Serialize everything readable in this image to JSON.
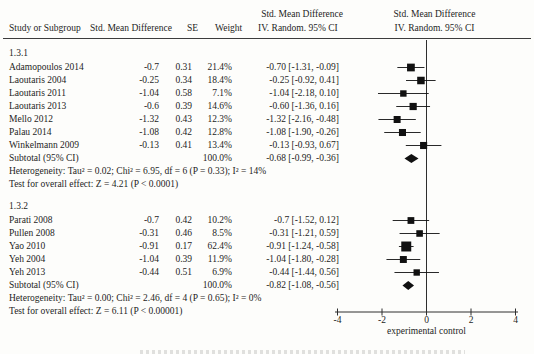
{
  "headers": {
    "left_effect": "Std. Mean Difference",
    "study": "Study or Subgroup",
    "smd": "Std. Mean Difference",
    "se": "SE",
    "weight": "Weight",
    "ci": "IV. Random. 95% CI",
    "plot_effect": "Std. Mean Difference",
    "plot_method": "IV. Random. 95% CI"
  },
  "chart_data": {
    "type": "forest",
    "effect_measure": "Std. Mean Difference",
    "method": "IV. Random. 95% CI",
    "axis": {
      "min": -4,
      "max": 4,
      "ticks": [
        -4,
        -2,
        0,
        2,
        4
      ],
      "label": "experimental control"
    },
    "marker_color": "#111111",
    "subgroups": [
      {
        "label": "1.3.1",
        "studies": [
          {
            "name": "Adamopoulos 2014",
            "smd": "-0.7",
            "se": "0.31",
            "weight": "21.4%",
            "ci": "-0.70 [-1.31, -0.09]",
            "est": -0.7,
            "lo": -1.31,
            "hi": -0.09,
            "w": 21.4
          },
          {
            "name": "Laoutaris 2004",
            "smd": "-0.25",
            "se": "0.34",
            "weight": "18.4%",
            "ci": "-0.25 [-0.92, 0.41]",
            "est": -0.25,
            "lo": -0.92,
            "hi": 0.41,
            "w": 18.4
          },
          {
            "name": "Laoutaris 2011",
            "smd": "-1.04",
            "se": "0.58",
            "weight": "7.1%",
            "ci": "-1.04 [-2.18, 0.10]",
            "est": -1.04,
            "lo": -2.18,
            "hi": 0.1,
            "w": 7.1
          },
          {
            "name": "Laoutaris 2013",
            "smd": "-0.6",
            "se": "0.39",
            "weight": "14.6%",
            "ci": "-0.60 [-1.36, 0.16]",
            "est": -0.6,
            "lo": -1.36,
            "hi": 0.16,
            "w": 14.6
          },
          {
            "name": "Mello 2012",
            "smd": "-1.32",
            "se": "0.43",
            "weight": "12.3%",
            "ci": "-1.32 [-2.16, -0.48]",
            "est": -1.32,
            "lo": -2.16,
            "hi": -0.48,
            "w": 12.3
          },
          {
            "name": "Palau 2014",
            "smd": "-1.08",
            "se": "0.42",
            "weight": "12.8%",
            "ci": "-1.08 [-1.90, -0.26]",
            "est": -1.08,
            "lo": -1.9,
            "hi": -0.26,
            "w": 12.8
          },
          {
            "name": "Winkelmann 2009",
            "smd": "-0.13",
            "se": "0.41",
            "weight": "13.4%",
            "ci": "-0.13 [-0.93, 0.67]",
            "est": -0.13,
            "lo": -0.93,
            "hi": 0.67,
            "w": 13.4
          }
        ],
        "subtotal": {
          "name": "Subtotal (95% CI)",
          "weight": "100.0%",
          "ci": "-0.68 [-0.99, -0.36]",
          "est": -0.68,
          "lo": -0.99,
          "hi": -0.36
        },
        "heterogeneity": "Heterogeneity: Tau² = 0.02; Chi² = 6.95, df = 6 (P = 0.33); I² = 14%",
        "overall_effect": "Test for overall effect: Z = 4.21 (P < 0.0001)"
      },
      {
        "label": "1.3.2",
        "studies": [
          {
            "name": "Parati 2008",
            "smd": "-0.7",
            "se": "0.42",
            "weight": "10.2%",
            "ci": "-0.7 [-1.52, 0.12]",
            "est": -0.7,
            "lo": -1.52,
            "hi": 0.12,
            "w": 10.2
          },
          {
            "name": "Pullen 2008",
            "smd": "-0.31",
            "se": "0.46",
            "weight": "8.5%",
            "ci": "-0.31 [-1.21, 0.59]",
            "est": -0.31,
            "lo": -1.21,
            "hi": 0.59,
            "w": 8.5
          },
          {
            "name": "Yao 2010",
            "smd": "-0.91",
            "se": "0.17",
            "weight": "62.4%",
            "ci": "-0.91 [-1.24, -0.58]",
            "est": -0.91,
            "lo": -1.24,
            "hi": -0.58,
            "w": 62.4
          },
          {
            "name": "Yeh 2004",
            "smd": "-1.04",
            "se": "0.39",
            "weight": "11.9%",
            "ci": "-1.04 [-1.80, -0.28]",
            "est": -1.04,
            "lo": -1.8,
            "hi": -0.28,
            "w": 11.9
          },
          {
            "name": "Yeh 2013",
            "smd": "-0.44",
            "se": "0.51",
            "weight": "6.9%",
            "ci": "-0.44 [-1.44, 0.56]",
            "est": -0.44,
            "lo": -1.44,
            "hi": 0.56,
            "w": 6.9
          }
        ],
        "subtotal": {
          "name": "Subtotal (95% CI)",
          "weight": "100.0%",
          "ci": "-0.82 [-1.08, -0.56]",
          "est": -0.82,
          "lo": -1.08,
          "hi": -0.56
        },
        "heterogeneity": "Heterogeneity: Tau² = 0.00; Chi² = 2.46, df = 4 (P = 0.65); I² = 0%",
        "overall_effect": "Test for overall effect: Z = 6.11 (P < 0.00001)"
      }
    ]
  }
}
